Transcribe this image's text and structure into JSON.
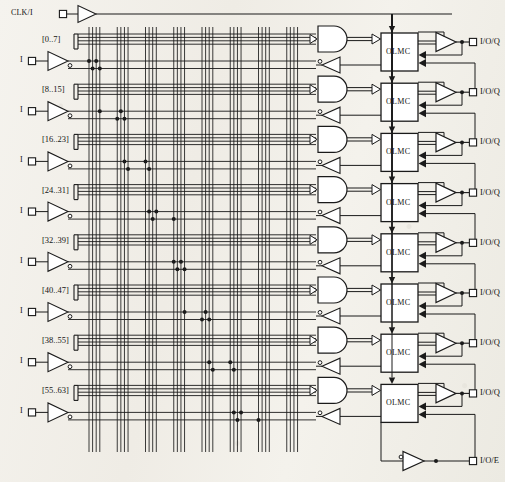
{
  "diagram": {
    "clock": {
      "label": "CLK/I"
    },
    "macrocell_label": "OLMC",
    "input_label": "I",
    "io_label": "I/O/Q",
    "io_enable_label": "I/O/E",
    "term_labels": [
      "[0..7]",
      "[8..15]",
      "[16..23]",
      "[24..31]",
      "[32..39]",
      "[40..47]",
      "[38..55]",
      "[55..63]"
    ],
    "rows": [
      {
        "term": "[0..7]",
        "input": "I",
        "macrocell": "OLMC",
        "output": "I/O/Q"
      },
      {
        "term": "[8..15]",
        "input": "I",
        "macrocell": "OLMC",
        "output": "I/O/Q"
      },
      {
        "term": "[16..23]",
        "input": "I",
        "macrocell": "OLMC",
        "output": "I/O/Q"
      },
      {
        "term": "[24..31]",
        "input": "I",
        "macrocell": "OLMC",
        "output": "I/O/Q"
      },
      {
        "term": "[32..39]",
        "input": "I",
        "macrocell": "OLMC",
        "output": "I/O/Q"
      },
      {
        "term": "[40..47]",
        "input": "I",
        "macrocell": "OLMC",
        "output": "I/O/Q"
      },
      {
        "term": "[38..55]",
        "input": "I",
        "macrocell": "OLMC",
        "output": "I/O/Q"
      },
      {
        "term": "[55..63]",
        "input": "I",
        "macrocell": "OLMC",
        "output": "I/O/Q"
      }
    ],
    "colors": {
      "line": "#1a1a1a",
      "paper": "#f3f1ec",
      "text": "#141414"
    },
    "array": {
      "columns": 32,
      "column_groups": 8,
      "columns_per_group": 4,
      "product_lines_per_row": 4,
      "macrocell_count": 8
    }
  }
}
